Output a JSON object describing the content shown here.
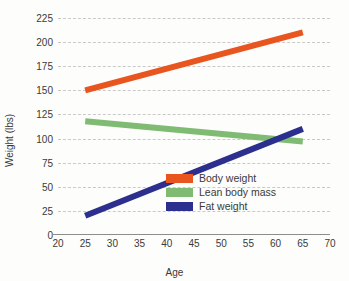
{
  "chart_data": {
    "type": "line",
    "title": "",
    "xlabel": "Age",
    "ylabel": "Weight (lbs)",
    "xlim": [
      20,
      70
    ],
    "ylim": [
      0,
      225
    ],
    "xticks": [
      "20",
      "25",
      "30",
      "35",
      "40",
      "45",
      "50",
      "55",
      "60",
      "65",
      "70"
    ],
    "yticks": [
      "0",
      "25",
      "50",
      "75",
      "100",
      "125",
      "150",
      "175",
      "200",
      "225"
    ],
    "grid": "horizontal-dashed",
    "legend_position": "bottom-right-inside",
    "x": [
      25,
      65
    ],
    "series": [
      {
        "name": "Body weight",
        "color": "#e8551f",
        "values": [
          150,
          210
        ]
      },
      {
        "name": "Lean body mass",
        "color": "#7fbb72",
        "values": [
          118,
          97
        ]
      },
      {
        "name": "Fat weight",
        "color": "#2d2f8f",
        "values": [
          20,
          110
        ]
      }
    ]
  }
}
